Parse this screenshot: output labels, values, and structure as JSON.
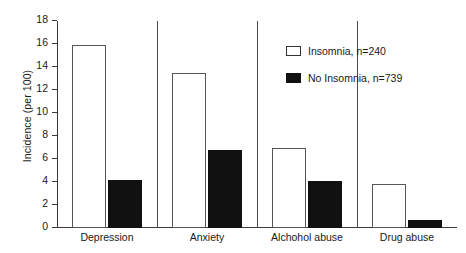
{
  "chart_data": {
    "type": "bar",
    "title": "",
    "xlabel": "",
    "ylabel": "Incidence (per 100)",
    "ylim": [
      0,
      18
    ],
    "ytick_step": 2,
    "yticks": [
      0,
      2,
      4,
      6,
      8,
      10,
      12,
      14,
      16,
      18
    ],
    "grid": false,
    "legend_position": "upper right",
    "categories": [
      "Depression",
      "Anxiety",
      "Alchohol abuse",
      "Drug abuse"
    ],
    "series": [
      {
        "name": "Insomnia, n=240",
        "style": "open",
        "color": "#ffffff",
        "edge_color": "#555555",
        "values": [
          15.9,
          13.5,
          7.0,
          3.85
        ]
      },
      {
        "name": "No Insomnia, n=739",
        "style": "filled",
        "color": "#111111",
        "edge_color": "#111111",
        "values": [
          4.2,
          6.8,
          4.1,
          0.7
        ]
      }
    ]
  },
  "legend": {
    "items": [
      {
        "label": "Insomnia, n=240",
        "style": "open"
      },
      {
        "label": "No Insomnia, n=739",
        "style": "filled"
      }
    ]
  }
}
